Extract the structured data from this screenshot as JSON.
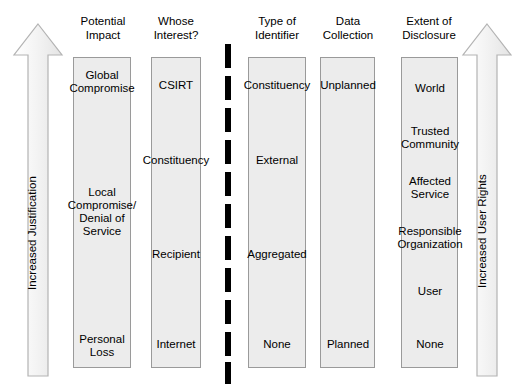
{
  "diagram": {
    "title_present": false,
    "colors": {
      "bar_fill": "#ececec",
      "bar_border": "#9a9a9a",
      "divider": "#000000",
      "arrow_fill": "#f2f2f2",
      "arrow_border": "#b0b0b0",
      "text": "#000000"
    },
    "left_arrow": {
      "label": "Increased Justification",
      "direction": "up",
      "icon": "up-arrow-icon"
    },
    "right_arrow": {
      "label": "Increased User Rights",
      "direction": "up",
      "icon": "up-arrow-icon"
    },
    "divider": {
      "style": "dashed-vertical",
      "segments": 11
    },
    "columns": [
      {
        "header": "Potential\nImpact",
        "name": "potential-impact",
        "values": [
          {
            "label": "Global\nCompromise",
            "y": 82
          },
          {
            "label": "Local\nCompromise/\nDenial of\nService",
            "y": 212
          },
          {
            "label": "Personal\nLoss",
            "y": 346
          }
        ]
      },
      {
        "header": "Whose\nInterest?",
        "name": "whose-interest",
        "values": [
          {
            "label": "CSIRT",
            "y": 85
          },
          {
            "label": "Constituency",
            "y": 160
          },
          {
            "label": "Recipient",
            "y": 254
          },
          {
            "label": "Internet",
            "y": 344
          }
        ]
      },
      {
        "header": "Type of\nIdentifier",
        "name": "type-of-identifier",
        "values": [
          {
            "label": "Constituency",
            "y": 85
          },
          {
            "label": "External",
            "y": 160
          },
          {
            "label": "Aggregated",
            "y": 254
          },
          {
            "label": "None",
            "y": 344
          }
        ]
      },
      {
        "header": "Data\nCollection",
        "name": "data-collection",
        "values": [
          {
            "label": "Unplanned",
            "y": 85
          },
          {
            "label": "Planned",
            "y": 344
          }
        ]
      },
      {
        "header": "Extent of\nDisclosure",
        "name": "extent-of-disclosure",
        "values": [
          {
            "label": "World",
            "y": 88
          },
          {
            "label": "Trusted\nCommunity",
            "y": 138
          },
          {
            "label": "Affected\nService",
            "y": 188
          },
          {
            "label": "Responsible\nOrganization",
            "y": 238
          },
          {
            "label": "User",
            "y": 291
          },
          {
            "label": "None",
            "y": 344
          }
        ]
      }
    ]
  }
}
